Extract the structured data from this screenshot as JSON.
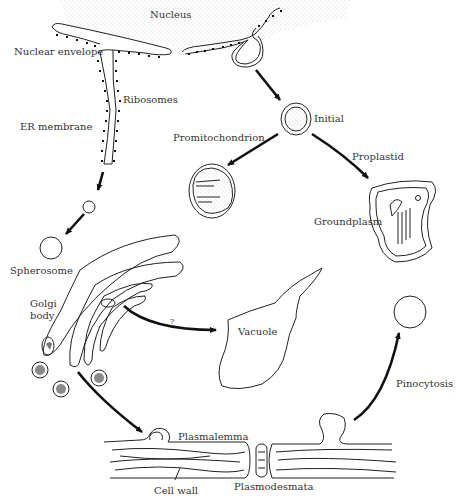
{
  "diagram": {
    "colors": {
      "line": "#222222",
      "text": "#333333",
      "stipple": "#9a9a9a",
      "background": "#ffffff"
    },
    "labels": {
      "nucleus": "Nucleus",
      "nuclear_envelope": "Nuclear envelope",
      "ribosomes": "Ribosomes",
      "er_membrane": "ER membrane",
      "initial": "Initial",
      "promitochondrion": "Promitochondrion",
      "proplastid": "Proplastid",
      "groundplasm": "Groundplasm",
      "spherosome": "Spherosome",
      "golgi_line1": "Golgi",
      "golgi_line2": "body",
      "question": "?",
      "vacuole": "Vacuole",
      "pinocytosis": "Pinocytosis",
      "plasmalemma": "Plasmalemma",
      "cell_wall": "Cell wall",
      "plasmodesmata": "Plasmodesmata"
    },
    "flows": [
      {
        "from": "Nuclear envelope",
        "to": "Initial"
      },
      {
        "from": "Initial",
        "to": "Promitochondrion"
      },
      {
        "from": "Initial",
        "to": "Proplastid"
      },
      {
        "from": "ER membrane",
        "to": "Spherosome"
      },
      {
        "from": "Golgi body",
        "to": "Vacuole",
        "label": "?"
      },
      {
        "from": "Golgi body",
        "to": "Plasmalemma"
      },
      {
        "from": "Plasmalemma",
        "to": "Pinocytosis vesicle"
      }
    ]
  }
}
